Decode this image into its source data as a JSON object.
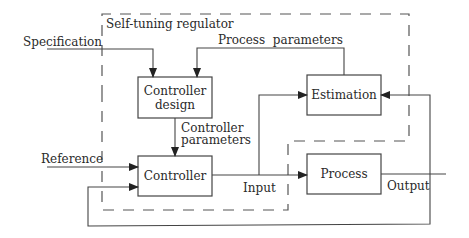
{
  "diagram": {
    "type": "block-diagram",
    "title": "Self-tuning regulator",
    "colors": {
      "line": "#444444",
      "text": "#2a2a2a",
      "background": "#ffffff"
    },
    "blocks": [
      {
        "id": "controller_design",
        "label_line1": "Controller",
        "label_line2": "design"
      },
      {
        "id": "controller",
        "label": "Controller"
      },
      {
        "id": "estimation",
        "label": "Estimation"
      },
      {
        "id": "process",
        "label": "Process"
      }
    ],
    "signals": {
      "specification": "Specification",
      "process_parameters": "Process  parameters",
      "controller_parameters_line1": "Controller",
      "controller_parameters_line2": "parameters",
      "reference": "Reference",
      "input": "Input",
      "output": "Output"
    }
  }
}
